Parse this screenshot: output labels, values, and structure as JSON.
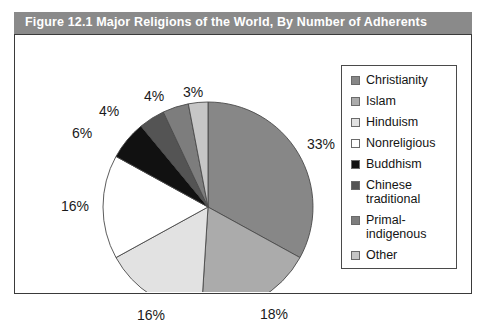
{
  "figure": {
    "title": "Figure 12.1  Major Religions of the World, By Number of Adherents",
    "banner_color": "#8a8a8a",
    "border_color": "#3a3a3a"
  },
  "legend": {
    "items": [
      {
        "label": "Christianity",
        "color": "#878787"
      },
      {
        "label": "Islam",
        "color": "#ababab"
      },
      {
        "label": "Hinduism",
        "color": "#e2e2e2"
      },
      {
        "label": "Nonreligious",
        "color": "#ffffff"
      },
      {
        "label": "Buddhism",
        "color": "#111111"
      },
      {
        "label": "Chinese traditional",
        "color": "#545454"
      },
      {
        "label": "Primal-indigenous",
        "color": "#7d7d7d"
      },
      {
        "label": "Other",
        "color": "#c6c6c6"
      }
    ]
  },
  "chart_data": {
    "type": "pie",
    "title": "Figure 12.1  Major Religions of the World, By Number of Adherents",
    "xlabel": "",
    "ylabel": "",
    "legend_position": "right",
    "grid": false,
    "start_angle_deg": 0,
    "direction": "clockwise",
    "categories": [
      "Christianity",
      "Islam",
      "Hinduism",
      "Nonreligious",
      "Buddhism",
      "Chinese traditional",
      "Primal-indigenous",
      "Other"
    ],
    "values": [
      33,
      18,
      16,
      16,
      6,
      4,
      4,
      3
    ],
    "value_unit": "percent",
    "colors": [
      "#878787",
      "#ababab",
      "#e2e2e2",
      "#ffffff",
      "#111111",
      "#545454",
      "#7d7d7d",
      "#c6c6c6"
    ],
    "slice_labels": [
      "33%",
      "18%",
      "16%",
      "16%",
      "6%",
      "4%",
      "4%",
      "3%"
    ]
  },
  "pie_labels": [
    {
      "text": "33%",
      "x": 292,
      "y": 101
    },
    {
      "text": "18%",
      "x": 245,
      "y": 271
    },
    {
      "text": "16%",
      "x": 122,
      "y": 272
    },
    {
      "text": "16%",
      "x": 46,
      "y": 163
    },
    {
      "text": "6%",
      "x": 57,
      "y": 90
    },
    {
      "text": "4%",
      "x": 84,
      "y": 68
    },
    {
      "text": "4%",
      "x": 129,
      "y": 53
    },
    {
      "text": "3%",
      "x": 168,
      "y": 49
    }
  ]
}
